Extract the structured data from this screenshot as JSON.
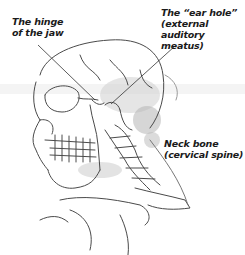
{
  "labels": {
    "hinge": {
      "line1": "The hinge",
      "line2": "of the jaw"
    },
    "ear": {
      "line1": "The “ear hole”",
      "line2": "(external auditory",
      "line3": "meatus)"
    },
    "neck": {
      "line1": "Neck bone",
      "line2": "(cervical spine)"
    }
  },
  "illustration": {
    "subject": "skull-and-cervical-spine-sketch",
    "stroke_color": "#4a4a4a",
    "shade_color": "#a8a8a8"
  }
}
